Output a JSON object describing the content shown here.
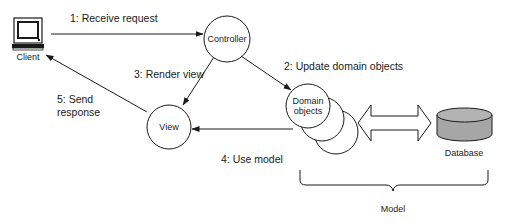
{
  "diagram": {
    "type": "MVC architecture",
    "nodes": {
      "client": {
        "label": "Client",
        "icon": "computer-monitor-icon"
      },
      "controller": {
        "label": "Controller"
      },
      "view": {
        "label": "View"
      },
      "domain": {
        "label_line1": "Domain",
        "label_line2": "objects"
      },
      "database": {
        "label": "Database",
        "fill": "#a6a6a6"
      },
      "model": {
        "label": "Model"
      }
    },
    "edges": [
      {
        "id": 1,
        "from": "client",
        "to": "controller",
        "label": "1: Receive request"
      },
      {
        "id": 2,
        "from": "controller",
        "to": "domain",
        "label": "2: Update domain objects"
      },
      {
        "id": 3,
        "from": "controller",
        "to": "view",
        "label": "3: Render view"
      },
      {
        "id": 4,
        "from": "domain",
        "to": "view",
        "label": "4: Use model"
      },
      {
        "id": 5,
        "from": "view",
        "to": "client",
        "label_line1": "5: Send",
        "label_line2": "response"
      },
      {
        "id": 6,
        "from": "domain",
        "to": "database",
        "label": "",
        "style": "double-headed hollow arrow"
      }
    ],
    "colors": {
      "line": "#1a1a1a",
      "database_fill": "#a6a6a6",
      "database_top": "#b3b3b3",
      "background": "#ffffff"
    }
  }
}
